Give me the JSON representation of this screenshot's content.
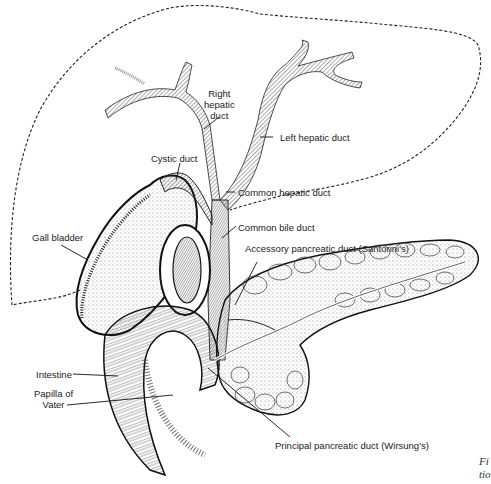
{
  "figure": {
    "labels": {
      "right_hepatic_duct": [
        "Right",
        "hepatic",
        "duct"
      ],
      "left_hepatic_duct": "Left hepatic duct",
      "cystic_duct": "Cystic duct",
      "common_hepatic_duct": "Common hepatic duct",
      "common_bile_duct": "Common bile duct",
      "gall_bladder": "Gall bladder",
      "accessory_pancreatic_duct": "Accessory pancreatic duct (Santorini's)",
      "intestine": "Intestine",
      "papilla_of_vater": [
        "Papilla of",
        "Vater"
      ],
      "principal_pancreatic_duct": "Principal pancreatic duct (Wirsung's)"
    },
    "caption_fragment": [
      "Fi",
      "tio"
    ],
    "colors": {
      "ink": "#222222",
      "background": "#ffffff",
      "stipple": "#bdbdbd"
    }
  }
}
